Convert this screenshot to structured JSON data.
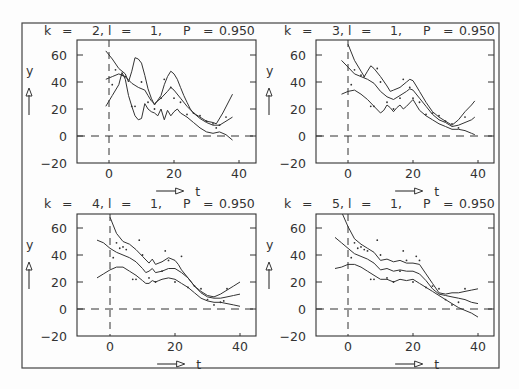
{
  "figure": {
    "frame": {
      "x": 22,
      "y": 23,
      "w": 477,
      "h": 345
    },
    "colors": {
      "ink": "#333333",
      "background": "#fdfdfd"
    }
  },
  "chart_data": [
    {
      "type": "line",
      "title": "k =  2, l =  1,    P = 0.950",
      "params": {
        "k": 2,
        "l": 1,
        "P": 0.95
      },
      "xlabel": "t",
      "ylabel": "y",
      "xticks": [
        0,
        20,
        40
      ],
      "yticks": [
        -20,
        0,
        20,
        40,
        60
      ],
      "xlim": [
        -10,
        45
      ],
      "ylim": [
        -20,
        70
      ],
      "grid": false,
      "reference_lines": {
        "t": 0,
        "y": 0
      },
      "series": [
        {
          "name": "upper band",
          "x": [
            -1,
            1,
            3,
            5,
            6,
            7,
            8,
            9,
            10,
            11,
            12,
            13,
            14,
            16,
            17,
            18,
            19,
            20,
            21,
            22,
            23,
            24,
            25,
            26,
            28,
            30,
            32,
            33,
            35,
            38
          ],
          "y": [
            63,
            57,
            50,
            46,
            40,
            48,
            58,
            57,
            54,
            45,
            35,
            28,
            23,
            30,
            38,
            44,
            48,
            46,
            42,
            36,
            30,
            25,
            20,
            17,
            14,
            11,
            10,
            9,
            17,
            31
          ]
        },
        {
          "name": "fit",
          "x": [
            -1,
            1,
            3,
            5,
            7,
            9,
            11,
            12,
            13,
            14,
            16,
            18,
            19,
            20,
            22,
            24,
            26,
            28,
            30,
            32,
            34,
            36,
            38
          ],
          "y": [
            42,
            44,
            46,
            44,
            39,
            36,
            34,
            30,
            26,
            24,
            28,
            33,
            36,
            34,
            28,
            22,
            17,
            13,
            10,
            8,
            8,
            11,
            14
          ]
        },
        {
          "name": "lower band",
          "x": [
            -1,
            1,
            3,
            4,
            5,
            6,
            7,
            8,
            9,
            10,
            11,
            12,
            13,
            14,
            15,
            16,
            17,
            18,
            19,
            20,
            21,
            22,
            24,
            26,
            28,
            30,
            32,
            34,
            36,
            38
          ],
          "y": [
            22,
            30,
            38,
            47,
            42,
            30,
            22,
            15,
            12,
            13,
            24,
            20,
            18,
            17,
            15,
            20,
            12,
            19,
            15,
            18,
            20,
            17,
            14,
            10,
            6,
            3,
            2,
            3,
            1,
            -3
          ]
        },
        {
          "name": "observations",
          "type": "scatter",
          "x": [
            1,
            2,
            4,
            5,
            7,
            8,
            10,
            12,
            14,
            16,
            17,
            19,
            20,
            22,
            24,
            26,
            28,
            30,
            32,
            33,
            34,
            36
          ],
          "y": [
            38,
            49,
            45,
            44,
            22,
            22,
            40,
            25,
            20,
            28,
            42,
            36,
            28,
            25,
            16,
            17,
            15,
            11,
            9,
            6,
            8,
            14
          ]
        }
      ]
    },
    {
      "type": "line",
      "title": "k =  3, l =  1,    P = 0.950",
      "params": {
        "k": 3,
        "l": 1,
        "P": 0.95
      },
      "xlabel": "t",
      "ylabel": "y",
      "xticks": [
        0,
        20,
        40
      ],
      "yticks": [
        -20,
        0,
        20,
        40,
        60
      ],
      "xlim": [
        -10,
        45
      ],
      "ylim": [
        -20,
        70
      ],
      "grid": false,
      "reference_lines": {
        "t": 0,
        "y": 0
      },
      "series": [
        {
          "name": "upper band",
          "x": [
            0,
            2,
            4,
            5,
            6,
            7,
            8,
            10,
            12,
            13,
            14,
            16,
            18,
            19,
            20,
            21,
            22,
            24,
            26,
            28,
            30,
            32,
            34,
            36,
            38,
            39
          ],
          "y": [
            68,
            56,
            48,
            44,
            48,
            52,
            50,
            44,
            37,
            33,
            34,
            36,
            40,
            42,
            41,
            37,
            33,
            25,
            18,
            14,
            11,
            8,
            12,
            18,
            23,
            26
          ]
        },
        {
          "name": "fit",
          "x": [
            -2,
            0,
            2,
            4,
            6,
            8,
            10,
            12,
            14,
            16,
            18,
            19,
            20,
            22,
            24,
            26,
            28,
            30,
            32,
            34,
            36,
            38,
            39
          ],
          "y": [
            56,
            51,
            46,
            44,
            42,
            39,
            33,
            29,
            27,
            30,
            33,
            35,
            34,
            28,
            22,
            16,
            12,
            10,
            7,
            8,
            10,
            12,
            14
          ]
        },
        {
          "name": "lower band",
          "x": [
            -2,
            0,
            2,
            4,
            6,
            8,
            10,
            11,
            12,
            13,
            14,
            15,
            16,
            17,
            18,
            20,
            21,
            22,
            24,
            26,
            28,
            30,
            32,
            34,
            36,
            38,
            39
          ],
          "y": [
            31,
            33,
            34,
            31,
            27,
            22,
            17,
            19,
            23,
            21,
            18,
            21,
            23,
            20,
            22,
            27,
            23,
            19,
            15,
            12,
            9,
            7,
            5,
            5,
            4,
            2,
            1
          ]
        },
        {
          "name": "observations",
          "type": "scatter",
          "x": [
            1,
            2,
            4,
            5,
            7,
            8,
            9,
            10,
            12,
            14,
            16,
            17,
            19,
            20,
            22,
            24,
            26,
            28,
            30,
            32,
            34,
            36
          ],
          "y": [
            38,
            49,
            45,
            44,
            22,
            22,
            50,
            40,
            25,
            20,
            28,
            42,
            36,
            28,
            25,
            16,
            17,
            15,
            11,
            9,
            6,
            14
          ]
        }
      ]
    },
    {
      "type": "line",
      "title": "k =  4, l =  1,    P = 0.950",
      "params": {
        "k": 4,
        "l": 1,
        "P": 0.95
      },
      "xlabel": "t",
      "ylabel": "y",
      "xticks": [
        0,
        20,
        40
      ],
      "yticks": [
        -20,
        0,
        20,
        40,
        60
      ],
      "xlim": [
        -10,
        45
      ],
      "ylim": [
        -20,
        70
      ],
      "grid": false,
      "reference_lines": {
        "t": 0,
        "y": 0
      },
      "series": [
        {
          "name": "upper band",
          "x": [
            0,
            2,
            4,
            6,
            8,
            10,
            12,
            13,
            14,
            16,
            18,
            20,
            21,
            22,
            24,
            26,
            28,
            30,
            32,
            34,
            36,
            38,
            40
          ],
          "y": [
            68,
            56,
            50,
            48,
            44,
            39,
            34,
            37,
            33,
            35,
            38,
            36,
            33,
            29,
            23,
            17,
            13,
            10,
            9,
            11,
            14,
            17,
            20
          ]
        },
        {
          "name": "fit",
          "x": [
            -4,
            -2,
            0,
            2,
            4,
            6,
            8,
            10,
            11,
            12,
            13,
            14,
            16,
            18,
            20,
            22,
            24,
            26,
            28,
            30,
            32,
            34,
            36,
            38,
            40
          ],
          "y": [
            51,
            49,
            45,
            42,
            40,
            38,
            35,
            30,
            27,
            28,
            30,
            27,
            28,
            30,
            30,
            27,
            23,
            17,
            12,
            9,
            8,
            8,
            9,
            10,
            11
          ]
        },
        {
          "name": "lower band",
          "x": [
            -4,
            -2,
            0,
            2,
            4,
            6,
            8,
            10,
            11,
            12,
            13,
            14,
            15,
            16,
            18,
            20,
            22,
            24,
            26,
            28,
            30,
            32,
            34,
            36,
            38,
            40
          ],
          "y": [
            23,
            26,
            29,
            31,
            31,
            28,
            25,
            21,
            19,
            19,
            21,
            20,
            21,
            22,
            23,
            22,
            19,
            16,
            12,
            8,
            6,
            5,
            5,
            4,
            3,
            2
          ]
        },
        {
          "name": "observations",
          "type": "scatter",
          "x": [
            1,
            2,
            3,
            4,
            5,
            7,
            8,
            9,
            10,
            12,
            14,
            16,
            17,
            18,
            20,
            22,
            24,
            26,
            28,
            30,
            32,
            34,
            35,
            36
          ],
          "y": [
            38,
            49,
            45,
            46,
            44,
            22,
            22,
            51,
            40,
            23,
            20,
            28,
            43,
            36,
            20,
            39,
            16,
            17,
            15,
            7,
            3,
            5,
            6,
            15
          ]
        }
      ]
    },
    {
      "type": "line",
      "title": "k =  5, l =  1,    P = 0.950",
      "params": {
        "k": 5,
        "l": 1,
        "P": 0.95
      },
      "xlabel": "t",
      "ylabel": "y",
      "xticks": [
        0,
        20,
        40
      ],
      "yticks": [
        -20,
        0,
        20,
        40,
        60
      ],
      "xlim": [
        -10,
        45
      ],
      "ylim": [
        -20,
        70
      ],
      "grid": false,
      "reference_lines": {
        "t": 0,
        "y": 0
      },
      "series": [
        {
          "name": "upper band",
          "x": [
            -2,
            0,
            2,
            4,
            6,
            8,
            10,
            12,
            14,
            16,
            18,
            20,
            22,
            24,
            26,
            28,
            30,
            32,
            34,
            36,
            38,
            40
          ],
          "y": [
            72,
            61,
            52,
            48,
            45,
            42,
            36,
            37,
            35,
            36,
            34,
            34,
            33,
            26,
            19,
            12,
            11,
            12,
            12,
            13,
            14,
            15
          ]
        },
        {
          "name": "fit",
          "x": [
            -4,
            -2,
            0,
            2,
            4,
            6,
            8,
            10,
            12,
            14,
            16,
            18,
            20,
            22,
            24,
            26,
            28,
            30,
            32,
            34,
            36,
            38,
            40
          ],
          "y": [
            53,
            49,
            45,
            41,
            39,
            37,
            34,
            29,
            30,
            28,
            29,
            28,
            28,
            26,
            21,
            15,
            11,
            10,
            9,
            8,
            7,
            5,
            4
          ]
        },
        {
          "name": "lower band",
          "x": [
            -4,
            -2,
            0,
            2,
            4,
            6,
            8,
            10,
            12,
            14,
            16,
            18,
            20,
            22,
            24,
            26,
            28,
            30,
            32,
            34,
            36,
            38,
            40
          ],
          "y": [
            30,
            31,
            33,
            33,
            31,
            28,
            25,
            22,
            22,
            20,
            22,
            21,
            22,
            19,
            16,
            13,
            10,
            7,
            4,
            1,
            -1,
            -3,
            -6
          ]
        },
        {
          "name": "observations",
          "type": "scatter",
          "x": [
            1,
            2,
            3,
            4,
            5,
            6,
            7,
            8,
            9,
            10,
            12,
            14,
            16,
            17,
            18,
            20,
            21,
            22,
            24,
            26,
            28,
            30,
            32,
            34,
            36
          ],
          "y": [
            38,
            49,
            45,
            46,
            44,
            43,
            22,
            22,
            51,
            40,
            23,
            20,
            28,
            43,
            36,
            20,
            39,
            36,
            16,
            17,
            15,
            7,
            3,
            5,
            15
          ]
        }
      ]
    }
  ],
  "panels": [
    {
      "k_label": "k",
      "eq": "=",
      "k_value": "2,",
      "l_label": "l",
      "l_value": "1,",
      "p_label": "P",
      "p_value": "0.950"
    },
    {
      "k_label": "k",
      "eq": "=",
      "k_value": "3,",
      "l_label": "l",
      "l_value": "1,",
      "p_label": "P",
      "p_value": "0.950"
    },
    {
      "k_label": "k",
      "eq": "=",
      "k_value": "4,",
      "l_label": "l",
      "l_value": "1,",
      "p_label": "P",
      "p_value": "0.950"
    },
    {
      "k_label": "k",
      "eq": "=",
      "k_value": "5,",
      "l_label": "l",
      "l_value": "1,",
      "p_label": "P",
      "p_value": "0.950"
    }
  ],
  "axis_text": {
    "ytick_labels": [
      "60",
      "40",
      "20",
      "0",
      "−20"
    ],
    "xtick_labels": [
      "0",
      "20",
      "40"
    ],
    "ylabel": "y",
    "xlabel": "t"
  }
}
